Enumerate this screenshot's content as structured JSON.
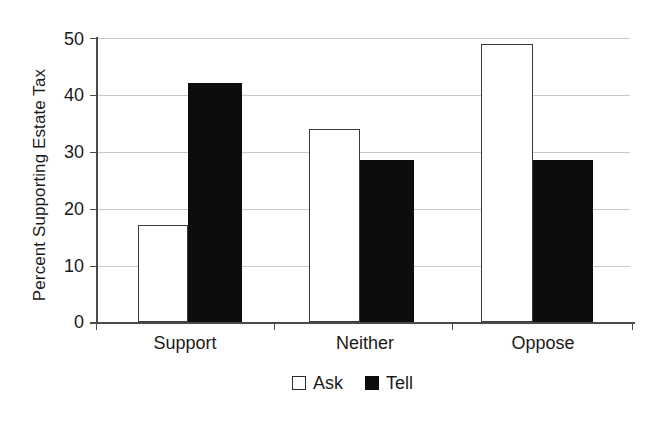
{
  "chart_data": {
    "type": "bar",
    "title": "",
    "xlabel": "",
    "ylabel": "Percent Supporting Estate Tax",
    "categories": [
      "Support",
      "Neither",
      "Oppose"
    ],
    "series": [
      {
        "name": "Ask",
        "values": [
          17,
          34,
          49
        ],
        "color": "#ffffff"
      },
      {
        "name": "Tell",
        "values": [
          42,
          28.5,
          28.5
        ],
        "color": "#0d0d0d"
      }
    ],
    "ylim": [
      0,
      50
    ],
    "yticks": [
      0,
      10,
      20,
      30,
      40,
      50
    ],
    "ytick_labels": [
      "0",
      "10",
      "20",
      "30",
      "40",
      "50"
    ],
    "grid": true,
    "legend_position": "bottom"
  },
  "axis": {
    "y_title": "Percent Supporting Estate Tax",
    "y_labels": [
      "50",
      "40",
      "30",
      "20",
      "10",
      "0"
    ]
  },
  "categories": [
    {
      "label": "Support"
    },
    {
      "label": "Neither"
    },
    {
      "label": "Oppose"
    }
  ],
  "legend": {
    "items": [
      {
        "label": "Ask",
        "swatch": "white-square-icon"
      },
      {
        "label": "Tell",
        "swatch": "black-square-icon"
      }
    ]
  }
}
